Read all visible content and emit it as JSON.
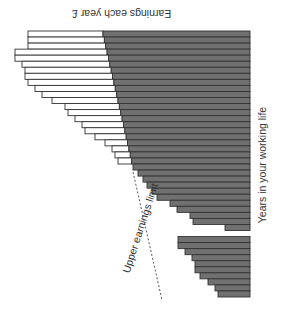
{
  "chart_data": {
    "type": "bar",
    "orientation": "horizontal (rotated figure)",
    "title": "Earnings each year £",
    "xlabel": "Earnings each year £",
    "ylabel": "Years in your working life",
    "annotations": [
      "Upper earnings limit"
    ],
    "grid": false,
    "legend": null,
    "colors": {
      "dark": "#707070",
      "light": "#ffffff",
      "outline": "#333333"
    },
    "years": [
      1,
      2,
      3,
      4,
      5,
      6,
      7,
      8,
      9,
      10,
      11,
      12,
      13,
      14,
      15,
      16,
      17,
      18,
      19,
      20,
      21,
      22,
      23,
      24,
      25,
      26,
      27,
      28,
      29,
      30,
      31,
      32,
      33,
      34,
      35,
      36,
      37,
      38,
      39,
      40,
      41,
      42,
      43,
      44
    ],
    "series": [
      {
        "name": "Total earnings (px units)",
        "values": [
          222,
          222,
          222,
          235,
          235,
          228,
          225,
          225,
          222,
          215,
          208,
          198,
          185,
          182,
          175,
          168,
          165,
          155,
          145,
          138,
          135,
          132,
          117,
          112,
          107,
          103,
          98,
          93,
          80,
          73,
          60,
          57,
          25,
          0,
          72,
          72,
          65,
          58,
          55,
          55,
          50,
          42,
          35,
          32
        ]
      },
      {
        "name": "Upper earnings limit (px units)",
        "values": [
          147,
          146,
          145,
          144,
          143,
          142,
          141,
          140,
          139,
          138,
          137,
          136,
          135,
          134,
          133,
          132,
          131,
          130,
          129,
          128,
          127,
          126,
          125,
          124,
          123,
          122,
          121,
          120,
          119,
          118,
          117,
          116,
          115,
          114,
          113,
          112,
          111,
          110,
          109,
          108,
          107,
          106,
          105,
          104
        ]
      }
    ]
  },
  "labels": {
    "title": "Earnings each year £",
    "y_axis": "Years in your working life",
    "limit": "Upper earnings limit"
  }
}
